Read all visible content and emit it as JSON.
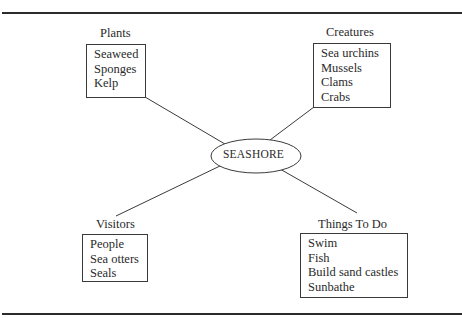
{
  "diagram": {
    "type": "concept-map",
    "center": {
      "label": "SEASHORE"
    },
    "branches": [
      {
        "id": "plants",
        "title": "Plants",
        "items": [
          "Seaweed",
          "Sponges",
          "Kelp"
        ]
      },
      {
        "id": "creatures",
        "title": "Creatures",
        "items": [
          "Sea urchins",
          "Mussels",
          "Clams",
          "Crabs"
        ]
      },
      {
        "id": "visitors",
        "title": "Visitors",
        "items": [
          "People",
          "Sea otters",
          "Seals"
        ]
      },
      {
        "id": "things_to_do",
        "title": "Things To Do",
        "items": [
          "Swim",
          "Fish",
          "Build sand castles",
          "Sunbathe"
        ]
      }
    ]
  },
  "colors": {
    "line": "#3a3a3a",
    "text": "#2a2a2a",
    "background": "#ffffff"
  }
}
